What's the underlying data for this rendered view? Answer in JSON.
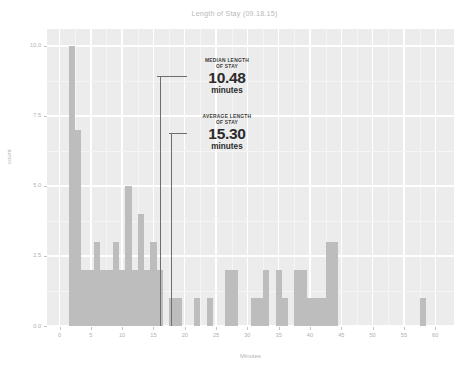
{
  "chart_data": {
    "type": "bar",
    "title": "Length of Stay (09.18.15)",
    "xlabel": "Minutes",
    "ylabel": "count",
    "xlim": [
      -2,
      63
    ],
    "ylim": [
      0,
      10.6
    ],
    "grid": true,
    "legend": "none",
    "bin_width": 1,
    "x_ticks": [
      "0",
      "5",
      "10",
      "15",
      "20",
      "25",
      "30",
      "35",
      "40",
      "45",
      "50",
      "55",
      "60"
    ],
    "x_tick_values": [
      0,
      5,
      10,
      15,
      20,
      25,
      30,
      35,
      40,
      45,
      50,
      55,
      60
    ],
    "y_ticks": [
      "0.0",
      "2.5",
      "5.0",
      "7.5",
      "10.0"
    ],
    "y_tick_values": [
      0,
      2.5,
      5,
      7.5,
      10
    ],
    "bar_color": "#bdbdbd",
    "panel_color": "#ececec",
    "x": [
      2,
      3,
      4,
      5,
      6,
      7,
      8,
      9,
      10,
      11,
      12,
      13,
      14,
      15,
      16,
      18,
      19,
      22,
      24,
      27,
      28,
      31,
      32,
      33,
      35,
      36,
      38,
      39,
      40,
      41,
      42,
      43,
      44,
      58
    ],
    "values": [
      10,
      7,
      2,
      2,
      3,
      2,
      2,
      3,
      2,
      5,
      2,
      4,
      2,
      3,
      2,
      1,
      1,
      1,
      1,
      2,
      2,
      1,
      1,
      2,
      2,
      1,
      2,
      2,
      1,
      1,
      1,
      3,
      3,
      1
    ],
    "categories": [
      "2",
      "3",
      "4",
      "5",
      "6",
      "7",
      "8",
      "9",
      "10",
      "11",
      "12",
      "13",
      "14",
      "15",
      "16",
      "18",
      "19",
      "22",
      "24",
      "27",
      "28",
      "31",
      "32",
      "33",
      "35",
      "36",
      "38",
      "39",
      "40",
      "41",
      "42",
      "43",
      "44",
      "58"
    ],
    "annotations": [
      {
        "id": "median",
        "kicker": "MEDIAN LENGTH OF STAY",
        "kicker_line1": "MEDIAN LENGTH",
        "kicker_line2": "OF STAY",
        "value": "10.48",
        "unit": "minutes",
        "x_value": 16.0
      },
      {
        "id": "average",
        "kicker": "AVERAGE LENGTH OF STAY",
        "kicker_line1": "AVERAGE LENGTH",
        "kicker_line2": "OF STAY",
        "value": "15.30",
        "unit": "minutes",
        "x_value": 17.8
      }
    ]
  }
}
